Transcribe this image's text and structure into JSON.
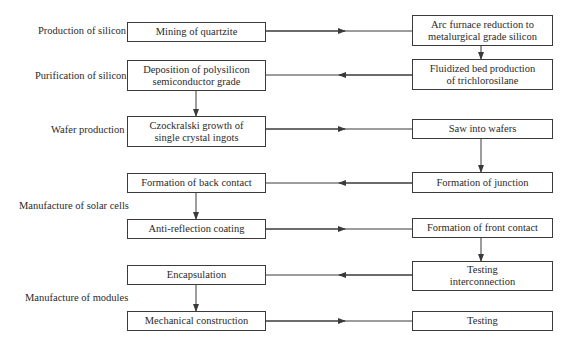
{
  "diagram": {
    "stages": [
      {
        "id": "production",
        "label": "Production of silicon"
      },
      {
        "id": "purification",
        "label": "Purification of silicon"
      },
      {
        "id": "wafer",
        "label": "Wafer production"
      },
      {
        "id": "cells",
        "label": "Manufacture of solar cells"
      },
      {
        "id": "modules",
        "label": "Manufacture of modules"
      }
    ],
    "nodes": {
      "mining": "Mining of quartzite",
      "arc": "Arc furnace reduction to\nmetalurgical grade silicon",
      "fluidized": "Fluidized bed production\nof trichlorosilane",
      "deposition": "Deposition of polysilicon\nsemiconductor grade",
      "czochralski": "Czockralski growth of\nsingle crystal ingots",
      "saw": "Saw into wafers",
      "junction": "Formation of junction",
      "back_contact": "Formation of back contact",
      "anti_reflection": "Anti-reflection coating",
      "front_contact": "Formation of front contact",
      "testing_interconnection": "Testing\ninterconnection",
      "encapsulation": "Encapsulation",
      "mechanical": "Mechanical construction",
      "testing": "Testing"
    },
    "edges": [
      [
        "mining",
        "arc"
      ],
      [
        "arc",
        "fluidized"
      ],
      [
        "fluidized",
        "deposition"
      ],
      [
        "deposition",
        "czochralski"
      ],
      [
        "czochralski",
        "saw"
      ],
      [
        "saw",
        "junction"
      ],
      [
        "junction",
        "back_contact"
      ],
      [
        "back_contact",
        "anti_reflection"
      ],
      [
        "anti_reflection",
        "front_contact"
      ],
      [
        "front_contact",
        "testing_interconnection"
      ],
      [
        "testing_interconnection",
        "encapsulation"
      ],
      [
        "encapsulation",
        "mechanical"
      ],
      [
        "mechanical",
        "testing"
      ]
    ],
    "colors": {
      "line": "#3a3a3a",
      "text": "#2a2a2a",
      "background": "#ffffff"
    }
  }
}
